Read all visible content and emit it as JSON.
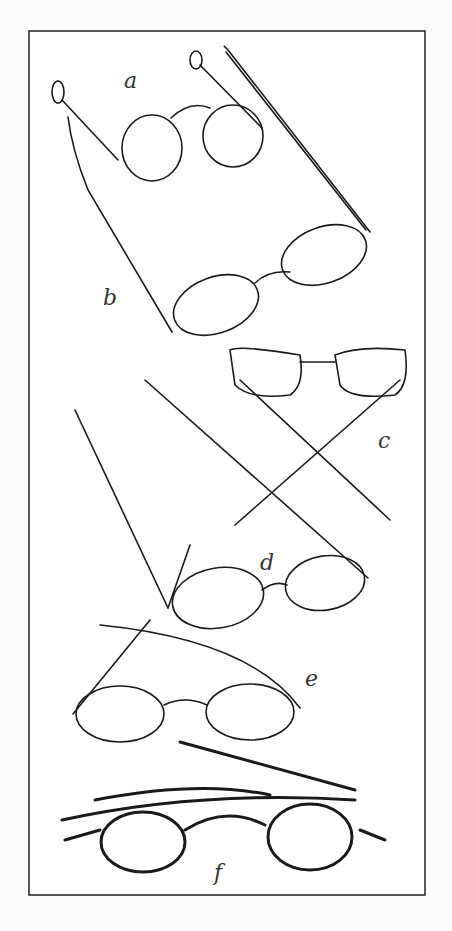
{
  "figure": {
    "labels": {
      "a": "a",
      "b": "b",
      "c": "c",
      "d": "d",
      "e": "e",
      "f": "f"
    },
    "colors": {
      "ink": "#1a1a1a",
      "paper": "#ffffff",
      "background": "#fbfbfb"
    }
  }
}
